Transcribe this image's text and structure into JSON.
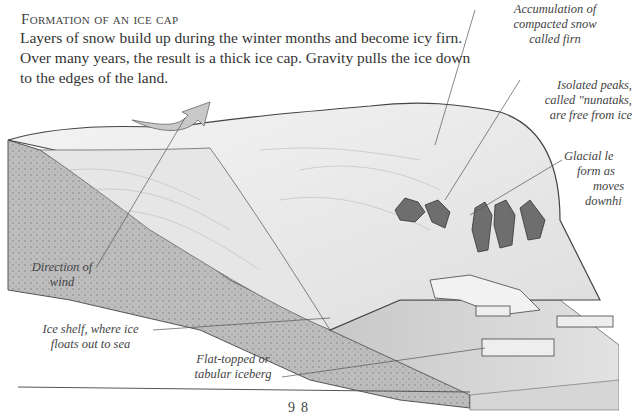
{
  "page": {
    "heading": "Formation of an ice cap",
    "body": "Layers of snow build up during the winter months and become icy firn. Over many years, the result is a thick ice cap. Gravity pulls the ice down to the edges of the land.",
    "page_number": "98"
  },
  "labels": {
    "firn": [
      "Accumulation of",
      "compacted snow",
      "called firn"
    ],
    "nunataks": [
      "Isolated peaks,",
      "called \"nunataks,",
      "are free from ice"
    ],
    "glacial": [
      "Glacial le",
      "form as",
      "moves",
      "downhi"
    ],
    "wind": [
      "Direction of",
      "wind"
    ],
    "ice_shelf": [
      "Ice shelf, where ice",
      "floats out to sea"
    ],
    "iceberg": [
      "Flat-topped or",
      "tabular iceberg"
    ]
  },
  "colors": {
    "ink": "#3a3a3a",
    "ice": "#eeeeee",
    "rock": "#b8b8b8",
    "sea": "#cfcfcf",
    "peaks": "#6e6e6e"
  }
}
